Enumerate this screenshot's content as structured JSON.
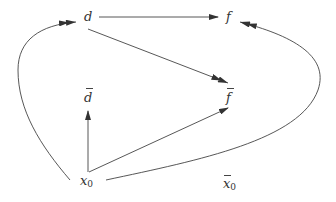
{
  "diagram": {
    "nodes": {
      "d": {
        "label": "d",
        "bar": false
      },
      "f": {
        "label": "f",
        "bar": false
      },
      "f_bar": {
        "label": "f",
        "bar": true
      },
      "d_bar": {
        "label": "d",
        "bar": true
      },
      "x0": {
        "label": "x",
        "sub": "0",
        "bar": false
      },
      "x0_bar": {
        "label": "x",
        "sub": "0",
        "bar": true
      }
    },
    "edges": [
      {
        "from": "d",
        "to": "f",
        "style": "straight",
        "head": "single"
      },
      {
        "from": "d",
        "to": "f_bar",
        "style": "straight",
        "head": "double"
      },
      {
        "from": "x0",
        "to": "d_bar",
        "style": "straight",
        "head": "single"
      },
      {
        "from": "x0",
        "to": "f_bar",
        "style": "straight",
        "head": "single"
      },
      {
        "from": "x0",
        "to": "d",
        "style": "curved-left",
        "head": "double"
      },
      {
        "from": "x0",
        "to": "f",
        "style": "curved-right",
        "head": "double"
      }
    ],
    "colors": {
      "stroke": "#444444",
      "text": "#333333",
      "background": "#ffffff"
    }
  }
}
